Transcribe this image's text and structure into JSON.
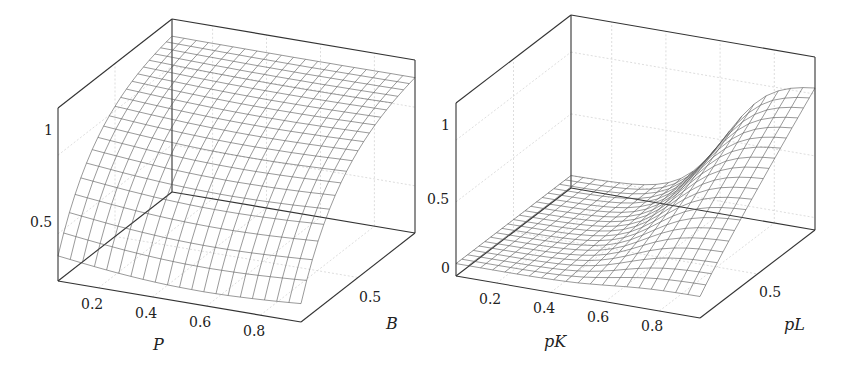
{
  "chart_data": [
    {
      "type": "surface",
      "title": "",
      "xlabel": "P",
      "ylabel": "B",
      "zlabel": "",
      "x_ticks": [
        "0.2",
        "0.4",
        "0.6",
        "0.8"
      ],
      "y_ticks": [
        "0.5"
      ],
      "z_ticks": [
        "0.5",
        "1"
      ],
      "xlim": [
        0.05,
        0.95
      ],
      "ylim": [
        0.05,
        0.95
      ],
      "zlim": [
        0.2,
        1.3
      ],
      "grid": true,
      "mesh_resolution": [
        20,
        20
      ],
      "description": "Surface rises steeply with B from about 0.25 at low B to about 1.25 at high B; nearly flat along P with a slight dip at mid-high P for low B.",
      "sample_values": {
        "B": [
          0.05,
          0.25,
          0.5,
          0.75,
          0.95
        ],
        "z_at_P_0.1": [
          0.32,
          0.62,
          0.98,
          1.17,
          1.23
        ],
        "z_at_P_0.5": [
          0.27,
          0.58,
          0.96,
          1.16,
          1.23
        ],
        "z_at_P_0.9": [
          0.25,
          0.55,
          0.94,
          1.15,
          1.22
        ]
      }
    },
    {
      "type": "surface",
      "title": "",
      "xlabel": "pK",
      "ylabel": "pL",
      "zlabel": "",
      "x_ticks": [
        "0.2",
        "0.4",
        "0.6",
        "0.8"
      ],
      "y_ticks": [
        "0.5"
      ],
      "z_ticks": [
        "0",
        "0.5",
        "1"
      ],
      "xlim": [
        0.05,
        0.95
      ],
      "ylim": [
        0.05,
        0.95
      ],
      "zlim": [
        -0.1,
        1.3
      ],
      "grid": true,
      "mesh_resolution": [
        20,
        20
      ],
      "description": "Surface is near 0 for low pK, rising sigmoidally toward about 1.1 at high pK and high pL.",
      "sample_values": {
        "pK": [
          0.05,
          0.25,
          0.5,
          0.75,
          0.95
        ],
        "z_at_pL_0.1": [
          0.0,
          0.0,
          0.01,
          0.05,
          0.1
        ],
        "z_at_pL_0.5": [
          0.0,
          0.01,
          0.1,
          0.5,
          0.7
        ],
        "z_at_pL_0.9": [
          0.0,
          0.02,
          0.25,
          0.95,
          1.1
        ]
      }
    }
  ],
  "plots": {
    "left": {
      "x_ticks": [
        "0.2",
        "0.4",
        "0.6",
        "0.8"
      ],
      "y_tick": "0.5",
      "z_ticks": [
        "0.5",
        "1"
      ],
      "xlabel": "P",
      "ylabel": "B"
    },
    "right": {
      "x_ticks": [
        "0.2",
        "0.4",
        "0.6",
        "0.8"
      ],
      "y_tick": "0.5",
      "z_ticks": [
        "0",
        "0.5",
        "1"
      ],
      "xlabel": "pK",
      "ylabel": "pL"
    }
  },
  "colors": {
    "mesh": "#555555",
    "box": "#333333",
    "grid": "#cfcfcf",
    "text": "#222222"
  }
}
